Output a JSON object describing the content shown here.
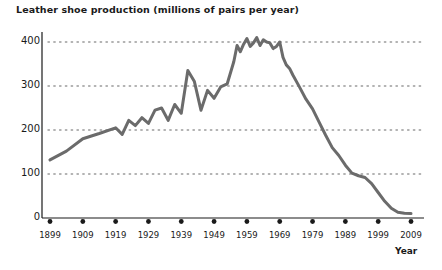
{
  "chart_data": {
    "type": "line",
    "title": "Leather shoe production (millions of pairs per year)",
    "xlabel": "Year",
    "ylabel": "",
    "xlim": [
      1899,
      2009
    ],
    "ylim": [
      0,
      430
    ],
    "yticks": [
      0,
      100,
      200,
      300,
      400
    ],
    "ytick_labels": [
      "0",
      "100",
      "200",
      "300",
      "400"
    ],
    "xticks": [
      1899,
      1909,
      1919,
      1929,
      1939,
      1949,
      1959,
      1969,
      1979,
      1989,
      1999,
      2009
    ],
    "xtick_labels": [
      "1899",
      "1909",
      "1919",
      "1929",
      "1939",
      "1949",
      "1959",
      "1969",
      "1979",
      "1989",
      "1999",
      "2009"
    ],
    "grid": "dotted-horizontal",
    "legend": "none",
    "line_color": "#6b6b6b",
    "line_width": 3,
    "axis_color": "#1a1a1a",
    "grid_color": "#9a9a9a",
    "tick_marker": "dot",
    "series": [
      {
        "name": "Leather shoe production",
        "x": [
          1899,
          1904,
          1909,
          1914,
          1919,
          1921,
          1923,
          1925,
          1927,
          1929,
          1931,
          1933,
          1935,
          1937,
          1939,
          1941,
          1943,
          1945,
          1947,
          1949,
          1951,
          1953,
          1955,
          1956,
          1957,
          1958,
          1959,
          1960,
          1961,
          1962,
          1963,
          1964,
          1965,
          1966,
          1967,
          1968,
          1969,
          1970,
          1971,
          1972,
          1973,
          1975,
          1977,
          1979,
          1981,
          1983,
          1985,
          1987,
          1989,
          1991,
          1993,
          1995,
          1997,
          1999,
          2001,
          2003,
          2005,
          2007,
          2009
        ],
        "y": [
          132,
          152,
          180,
          192,
          205,
          190,
          222,
          210,
          228,
          215,
          245,
          250,
          222,
          258,
          238,
          335,
          310,
          245,
          290,
          272,
          298,
          305,
          355,
          392,
          378,
          395,
          408,
          390,
          398,
          410,
          392,
          405,
          400,
          398,
          385,
          390,
          400,
          365,
          348,
          340,
          325,
          298,
          270,
          248,
          218,
          188,
          160,
          142,
          120,
          102,
          96,
          92,
          78,
          58,
          38,
          22,
          13,
          11,
          10
        ]
      }
    ]
  }
}
